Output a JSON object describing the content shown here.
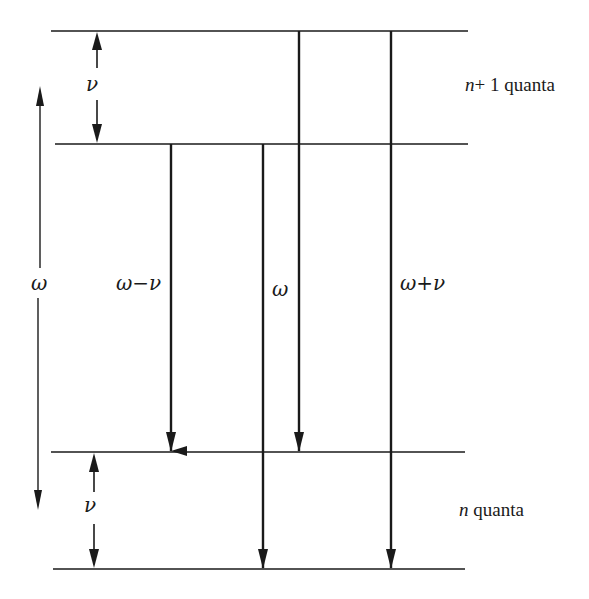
{
  "diagram": {
    "levels": [
      {
        "id": "n1-upper",
        "y": 31,
        "x1": 51,
        "x2": 468
      },
      {
        "id": "n1-lower",
        "y": 144,
        "x1": 55,
        "x2": 468
      },
      {
        "id": "n-upper",
        "y": 452,
        "x1": 51,
        "x2": 465
      },
      {
        "id": "n-lower",
        "y": 569,
        "x1": 53,
        "x2": 465
      }
    ],
    "groups": {
      "upper": {
        "n_label": "n",
        "rest_label": "+ 1 quanta"
      },
      "lower": {
        "n_label": "n",
        "rest_label": " quanta"
      }
    },
    "transitions": [
      {
        "label": "ω−ν",
        "x": 171,
        "from_y": 144,
        "to_y": 452
      },
      {
        "label": "ω",
        "x": 263,
        "from_y": 144,
        "to_y": 569
      },
      {
        "label": "",
        "x": 299,
        "from_y": 31,
        "to_y": 452
      },
      {
        "label": "ω+ν",
        "x": 391,
        "from_y": 31,
        "to_y": 569
      }
    ],
    "spacing_labels": {
      "upper_nu": "ν",
      "lower_nu": "ν",
      "omega_span": "ω"
    },
    "colors": {
      "line": "#1a1a1a",
      "background": "#ffffff"
    }
  }
}
